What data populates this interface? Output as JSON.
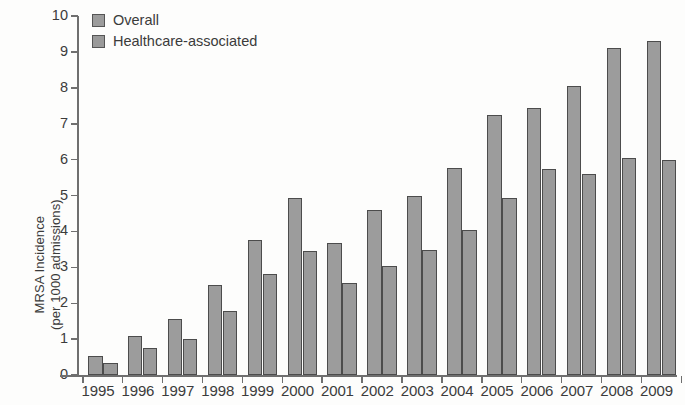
{
  "chart_data": {
    "type": "bar",
    "title": "",
    "subtitle": "",
    "xlabel": "",
    "ylabel": "MRSA Incidence (per 1000 admissions)",
    "ylabel_lines": [
      "MRSA Incidence",
      "(per 1000 admissions)"
    ],
    "ylim": [
      0,
      10
    ],
    "ytick_labels": [
      "10",
      "9",
      "8",
      "7",
      "6",
      "5",
      "4",
      "3",
      "2",
      "1",
      "0"
    ],
    "yticks": [
      10,
      9,
      8,
      7,
      6,
      5,
      4,
      3,
      2,
      1,
      0
    ],
    "grid": false,
    "legend_position": "top-left",
    "categories": [
      "1995",
      "1996",
      "1997",
      "1998",
      "1999",
      "2000",
      "2001",
      "2002",
      "2003",
      "2004",
      "2005",
      "2006",
      "2007",
      "2008",
      "2009"
    ],
    "series": [
      {
        "name": "Overall",
        "color": "#9c9c9c",
        "values": [
          0.52,
          1.08,
          1.55,
          2.5,
          3.75,
          4.93,
          3.67,
          4.6,
          5.0,
          5.78,
          7.23,
          7.45,
          8.05,
          9.1,
          9.3
        ]
      },
      {
        "name": "Healthcare-associated",
        "color": "#9a9a9a",
        "values": [
          0.33,
          0.76,
          1.0,
          1.78,
          2.82,
          3.45,
          2.55,
          3.03,
          3.48,
          4.04,
          4.93,
          5.73,
          5.6,
          6.05,
          5.98
        ]
      }
    ]
  },
  "legend": {
    "items": [
      {
        "label": "Overall",
        "color": "#9c9c9c"
      },
      {
        "label": "Healthcare-associated",
        "color": "#9a9a9a"
      }
    ]
  }
}
